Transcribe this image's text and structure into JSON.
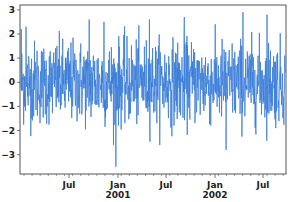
{
  "chart_data": {
    "type": "line",
    "title": "",
    "xlabel": "",
    "ylabel": "",
    "series": [
      {
        "name": "random walk noise",
        "color": "#3b7dd8",
        "n_points": 1000,
        "start": "2000-01-01",
        "freq": "D",
        "distribution": "normal(0,1)",
        "notable_points": [
          {
            "x": "2000-01-02",
            "y": 2.2
          },
          {
            "x": "2000-01-20",
            "y": 2.3
          },
          {
            "x": "2000-09-15",
            "y": 2.6
          },
          {
            "x": "2000-11-10",
            "y": 2.5
          },
          {
            "x": "2000-12-25",
            "y": -3.5
          },
          {
            "x": "2001-05-01",
            "y": 2.6
          },
          {
            "x": "2001-09-10",
            "y": 2.7
          },
          {
            "x": "2002-04-20",
            "y": 2.9
          },
          {
            "x": "2002-07-20",
            "y": 2.8
          },
          {
            "x": "2002-02-15",
            "y": -2.8
          }
        ]
      }
    ],
    "x_ticks": [
      {
        "label": "Jul",
        "sub": "",
        "x_px": 69
      },
      {
        "label": "Jan",
        "sub": "2001",
        "x_px": 118
      },
      {
        "label": "Jul",
        "sub": "",
        "x_px": 166
      },
      {
        "label": "Jan",
        "sub": "2002",
        "x_px": 215
      },
      {
        "label": "Jul",
        "sub": "",
        "x_px": 263
      }
    ],
    "y_ticks": [
      3,
      2,
      1,
      0,
      -1,
      -2,
      -3
    ],
    "ylim": [
      -3.8,
      3.2
    ],
    "xlim": [
      "2000-01-01",
      "2002-09-26"
    ],
    "grid": false,
    "legend": null
  }
}
